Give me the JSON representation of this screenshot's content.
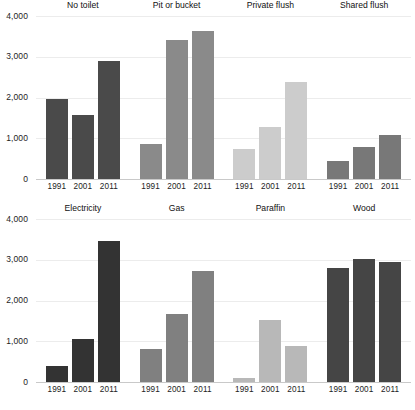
{
  "chart_data": {
    "type": "bar",
    "title": "",
    "subtitle": "",
    "xlabel": "",
    "ylabel": "",
    "ylim": [
      0,
      4000
    ],
    "grid": true,
    "legend": "none",
    "categories": [
      "1991",
      "2001",
      "2011"
    ],
    "yticks": [
      "0",
      "1,000",
      "2,000",
      "3,000",
      "4,000"
    ],
    "ytick_values": [
      0,
      1000,
      2000,
      3000,
      4000
    ],
    "panels": [
      {
        "title": "No toilet",
        "color": "#4a4a4a",
        "row": 0,
        "values": [
          1960,
          1580,
          2890
        ]
      },
      {
        "title": "Pit or bucket",
        "color": "#8a8a8a",
        "row": 0,
        "values": [
          870,
          3400,
          3640
        ]
      },
      {
        "title": "Private flush",
        "color": "#cccccc",
        "row": 0,
        "values": [
          730,
          1270,
          2370
        ]
      },
      {
        "title": "Shared flush",
        "color": "#787878",
        "row": 0,
        "values": [
          430,
          790,
          1090
        ]
      },
      {
        "title": "Electricity",
        "color": "#333333",
        "row": 1,
        "values": [
          400,
          1060,
          3450
        ]
      },
      {
        "title": "Gas",
        "color": "#808080",
        "row": 1,
        "values": [
          810,
          1680,
          2720
        ]
      },
      {
        "title": "Paraffin",
        "color": "#b8b8b8",
        "row": 1,
        "values": [
          100,
          1510,
          880
        ]
      },
      {
        "title": "Wood",
        "color": "#454545",
        "row": 1,
        "values": [
          2810,
          3030,
          2950
        ]
      }
    ]
  },
  "figure": {
    "background_color": "#ffffff",
    "gridline_color": "#ececec",
    "axis_color": "#c9c9c9",
    "text_color": "#1d1d1d"
  }
}
